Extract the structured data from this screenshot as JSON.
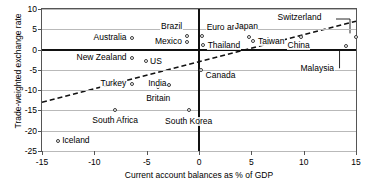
{
  "chart_data": {
    "type": "scatter",
    "title": "",
    "xlabel": "Current account balances as % of GDP",
    "ylabel": "Trade-weighted exchange rate",
    "xlim": [
      -15,
      15
    ],
    "ylim": [
      -25,
      10
    ],
    "xticks": [
      "-15",
      "-10",
      "-5",
      "0",
      "5",
      "10",
      "15"
    ],
    "xtick_values": [
      -15,
      -10,
      -5,
      0,
      5,
      10,
      15
    ],
    "yticks": [
      "10",
      "5",
      "0",
      "-5",
      "-10",
      "-15",
      "-20",
      "-25"
    ],
    "ytick_values": [
      10,
      5,
      0,
      -5,
      -10,
      -15,
      -20,
      -25
    ],
    "grid": "horizontal",
    "legend": "none",
    "points": [
      {
        "name": "Brazil",
        "x": -1.1,
        "y": 3.4,
        "label_dx": -5,
        "label_dy": -9,
        "anchor": "end"
      },
      {
        "name": "Mexico",
        "x": -1.1,
        "y": 1.9,
        "label_dx": -5,
        "label_dy": 0,
        "anchor": "end"
      },
      {
        "name": "Euro area",
        "x": 0.3,
        "y": 3.3,
        "label_dx": 4,
        "label_dy": -9,
        "anchor": "start"
      },
      {
        "name": "Japan",
        "x": 4.8,
        "y": 3.2,
        "label_dx": -3,
        "label_dy": -10,
        "anchor": "middle"
      },
      {
        "name": "Taiwan",
        "x": 5.2,
        "y": 2.0,
        "label_dx": 4,
        "label_dy": 0,
        "anchor": "start"
      },
      {
        "name": "Thailand",
        "x": 0.4,
        "y": 1.2,
        "label_dx": 4,
        "label_dy": 1,
        "anchor": "start"
      },
      {
        "name": "Switzerland",
        "x": 15.0,
        "y": 3.0,
        "label_dx": 0,
        "label_dy": 0,
        "anchor": "leader"
      },
      {
        "name": "China",
        "x": 9.7,
        "y": 3.1,
        "label_dx": -2,
        "label_dy": 9,
        "anchor": "middle"
      },
      {
        "name": "Malaysia",
        "x": 14.0,
        "y": 1.0,
        "label_dx": 0,
        "label_dy": 0,
        "anchor": "leader"
      },
      {
        "name": "Australia",
        "x": -6.4,
        "y": 2.9,
        "label_dx": -5,
        "label_dy": 0,
        "anchor": "end"
      },
      {
        "name": "New Zealand",
        "x": -6.4,
        "y": -2.0,
        "label_dx": -5,
        "label_dy": 0,
        "anchor": "end"
      },
      {
        "name": "US",
        "x": -5.1,
        "y": -2.9,
        "label_dx": 4,
        "label_dy": 0,
        "anchor": "start"
      },
      {
        "name": "Turkey",
        "x": -6.4,
        "y": -8.5,
        "label_dx": -5,
        "label_dy": -1,
        "anchor": "end"
      },
      {
        "name": "Britain",
        "x": -3.9,
        "y": -9.3,
        "label_dx": 0,
        "label_dy": 11,
        "anchor": "middle"
      },
      {
        "name": "India",
        "x": -2.9,
        "y": -8.7,
        "label_dx": -2,
        "label_dy": -1,
        "anchor": "end"
      },
      {
        "name": "Canada",
        "x": 0.2,
        "y": -5.0,
        "label_dx": 4,
        "label_dy": 6,
        "anchor": "start"
      },
      {
        "name": "South Africa",
        "x": -8.0,
        "y": -14.8,
        "label_dx": 0,
        "label_dy": 11,
        "anchor": "middle"
      },
      {
        "name": "South Korea",
        "x": -1.0,
        "y": -15.0,
        "label_dx": 0,
        "label_dy": 11,
        "anchor": "middle"
      },
      {
        "name": "Iceland",
        "x": -13.5,
        "y": -22.5,
        "label_dx": 4,
        "label_dy": 0,
        "anchor": "start"
      }
    ],
    "trendline": {
      "x0": -15,
      "y0": -13.0,
      "x1": 15,
      "y1": 7.0,
      "style": "dashed"
    }
  }
}
